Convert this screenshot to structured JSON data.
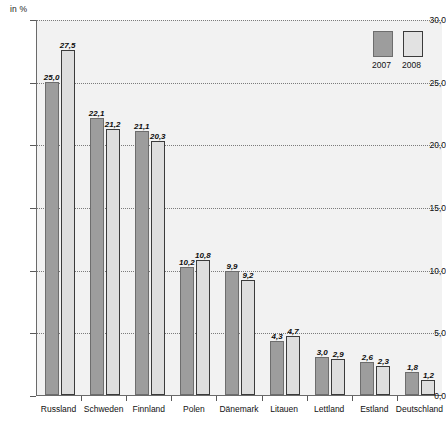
{
  "chart_data": {
    "type": "bar",
    "title": "",
    "subtitle": "",
    "xlabel": "",
    "ylabel": "in %",
    "axis_unit_label": "in %",
    "ylim": [
      0,
      30
    ],
    "ytick_values": [
      0,
      5,
      10,
      15,
      20,
      25,
      30
    ],
    "ytick_labels": [
      "0,0",
      "5,0",
      "10,0",
      "15,0",
      "20,0",
      "25,0",
      "30,0"
    ],
    "grid": true,
    "grid_axis": "y",
    "legend_position": "top-right",
    "categories": [
      "Russland",
      "Schweden",
      "Finnland",
      "Polen",
      "Dänemark",
      "Litauen",
      "Lettland",
      "Estland",
      "Deutschland"
    ],
    "series": [
      {
        "name": "2007",
        "color": "#9d9d9d",
        "values": [
          25.0,
          22.1,
          21.1,
          10.2,
          9.9,
          4.3,
          3.0,
          2.6,
          1.8
        ],
        "value_labels": [
          "25,0",
          "22,1",
          "21,1",
          "10,2",
          "9,9",
          "4,3",
          "3,0",
          "2,6",
          "1,8"
        ]
      },
      {
        "name": "2008",
        "color": "#dedede",
        "values": [
          27.5,
          21.2,
          20.3,
          10.8,
          9.2,
          4.7,
          2.9,
          2.3,
          1.2
        ],
        "value_labels": [
          "27,5",
          "21,2",
          "20,3",
          "10,8",
          "9,2",
          "4,7",
          "2,9",
          "2,3",
          "1,2"
        ]
      }
    ]
  },
  "legend": {
    "entries": [
      {
        "label": "2007",
        "color": "#9d9d9d"
      },
      {
        "label": "2008",
        "color": "#dedede"
      }
    ]
  },
  "colors": {
    "series_2007": "#9d9d9d",
    "series_2008": "#dedede",
    "plot_background": "#f2f2f2",
    "axis": "#6a6a6a",
    "gridline": "#7b7b7b",
    "text": "#111111"
  }
}
